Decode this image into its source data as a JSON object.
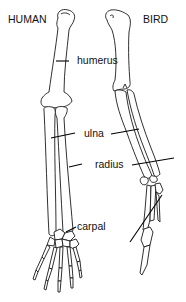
{
  "diagram": {
    "titles": {
      "left": "HUMAN",
      "right": "BIRD"
    },
    "labels": {
      "humerus": "humerus",
      "ulna": "ulna",
      "radius": "radius",
      "carpal": "carpal"
    },
    "colors": {
      "line": "#1a1a1a",
      "background": "#ffffff"
    }
  }
}
